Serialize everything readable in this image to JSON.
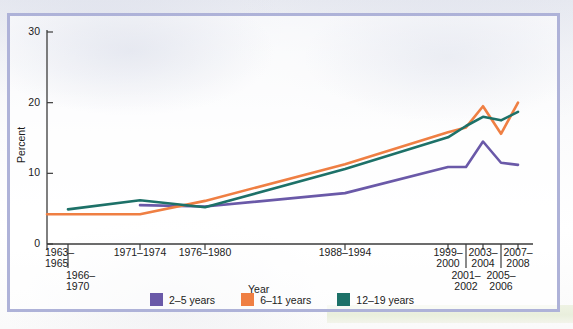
{
  "figure": {
    "frame_color": "#aeb2d8",
    "background_color": "#ffffff"
  },
  "chart_data": {
    "type": "line",
    "title": "",
    "xlabel": "Year",
    "ylabel": "Percent",
    "ylim": [
      0,
      30
    ],
    "yticks": [
      0,
      10,
      20,
      30
    ],
    "ytick_labels": [
      "0",
      "10",
      "20",
      "30"
    ],
    "grid": false,
    "legend_position": "bottom",
    "categories": [
      "1963-1965",
      "1966-1970",
      "1971-1974",
      "1976-1980",
      "1988-1994",
      "1999-2000",
      "2001-2002",
      "2003-2004",
      "2005-2006",
      "2007-2008"
    ],
    "xtick_labels": [
      {
        "line1": "1963–",
        "line2": "1965",
        "row": 0
      },
      {
        "line1": "1966–",
        "line2": "1970",
        "row": 1
      },
      {
        "line1": "1971–1974",
        "line2": "",
        "row": 0
      },
      {
        "line1": "1976–1980",
        "line2": "",
        "row": 0
      },
      {
        "line1": "1988–1994",
        "line2": "",
        "row": 0
      },
      {
        "line1": "1999–",
        "line2": "2000",
        "row": 0
      },
      {
        "line1": "2001–",
        "line2": "2002",
        "row": 1
      },
      {
        "line1": "2003–",
        "line2": "2004",
        "row": 0
      },
      {
        "line1": "2005–",
        "line2": "2006",
        "row": 1
      },
      {
        "line1": "2007–",
        "line2": "2008",
        "row": 0
      }
    ],
    "series": [
      {
        "name": "2–5 years",
        "color": "#6a59a8",
        "values": [
          null,
          null,
          5.5,
          5.3,
          7.2,
          10.9,
          10.9,
          14.5,
          11.5,
          11.2
        ]
      },
      {
        "name": "6–11 years",
        "color": "#ef7f43",
        "values": [
          4.2,
          4.2,
          4.2,
          6.1,
          11.3,
          15.8,
          16.5,
          19.5,
          15.6,
          20.0
        ]
      },
      {
        "name": "12–19 years",
        "color": "#1d7168",
        "values": [
          null,
          4.9,
          6.2,
          5.2,
          10.6,
          15.1,
          16.7,
          18.0,
          17.5,
          18.7
        ]
      }
    ]
  },
  "legend": {
    "items": [
      {
        "label": "2–5 years",
        "color": "#6a59a8"
      },
      {
        "label": "6–11 years",
        "color": "#ef7f43"
      },
      {
        "label": "12–19 years",
        "color": "#1d7168"
      }
    ]
  },
  "axes": {
    "y_title": "Percent",
    "x_title": "Year"
  }
}
